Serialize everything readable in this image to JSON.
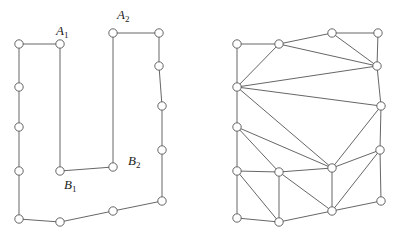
{
  "diagram": {
    "left": {
      "title": "polygon",
      "nodes": [
        {
          "id": "L0",
          "x": 19,
          "y": 44
        },
        {
          "id": "A1",
          "x": 60,
          "y": 44
        },
        {
          "id": "B1",
          "x": 60,
          "y": 171
        },
        {
          "id": "B2",
          "x": 113,
          "y": 167
        },
        {
          "id": "A2",
          "x": 113,
          "y": 33
        },
        {
          "id": "L5",
          "x": 159,
          "y": 33
        },
        {
          "id": "L6",
          "x": 159,
          "y": 66
        },
        {
          "id": "L7",
          "x": 162,
          "y": 106
        },
        {
          "id": "L8",
          "x": 162,
          "y": 150
        },
        {
          "id": "L9",
          "x": 162,
          "y": 201
        },
        {
          "id": "L10",
          "x": 113,
          "y": 211
        },
        {
          "id": "L11",
          "x": 60,
          "y": 222
        },
        {
          "id": "L12",
          "x": 19,
          "y": 219
        },
        {
          "id": "L13",
          "x": 19,
          "y": 171
        },
        {
          "id": "L14",
          "x": 19,
          "y": 127
        },
        {
          "id": "L15",
          "x": 19,
          "y": 87
        }
      ],
      "labels": [
        {
          "base": "A",
          "sub": "1",
          "x": 56,
          "y": 35
        },
        {
          "base": "A",
          "sub": "2",
          "x": 117,
          "y": 19
        },
        {
          "base": "B",
          "sub": "1",
          "x": 64,
          "y": 189
        },
        {
          "base": "B",
          "sub": "2",
          "x": 128,
          "y": 165
        }
      ]
    },
    "right": {
      "title": "triangulation",
      "nodes": [
        {
          "id": "R0",
          "x": 237,
          "y": 44
        },
        {
          "id": "R1",
          "x": 279,
          "y": 44
        },
        {
          "id": "R2",
          "x": 332,
          "y": 33
        },
        {
          "id": "R3",
          "x": 378,
          "y": 33
        },
        {
          "id": "R4",
          "x": 377,
          "y": 66
        },
        {
          "id": "R5",
          "x": 237,
          "y": 87
        },
        {
          "id": "R6",
          "x": 381,
          "y": 106
        },
        {
          "id": "R7",
          "x": 237,
          "y": 127
        },
        {
          "id": "R8",
          "x": 380,
          "y": 150
        },
        {
          "id": "R9",
          "x": 237,
          "y": 171
        },
        {
          "id": "R10",
          "x": 279,
          "y": 172
        },
        {
          "id": "R11",
          "x": 332,
          "y": 168
        },
        {
          "id": "R12",
          "x": 381,
          "y": 201
        },
        {
          "id": "R13",
          "x": 237,
          "y": 218
        },
        {
          "id": "R14",
          "x": 279,
          "y": 222
        },
        {
          "id": "R15",
          "x": 332,
          "y": 211
        }
      ],
      "edges": [
        [
          "R0",
          "R1"
        ],
        [
          "R1",
          "R2"
        ],
        [
          "R2",
          "R3"
        ],
        [
          "R3",
          "R4"
        ],
        [
          "R2",
          "R4"
        ],
        [
          "R1",
          "R4"
        ],
        [
          "R0",
          "R5"
        ],
        [
          "R1",
          "R5"
        ],
        [
          "R5",
          "R4"
        ],
        [
          "R4",
          "R6"
        ],
        [
          "R5",
          "R6"
        ],
        [
          "R5",
          "R7"
        ],
        [
          "R5",
          "R11"
        ],
        [
          "R6",
          "R11"
        ],
        [
          "R6",
          "R8"
        ],
        [
          "R7",
          "R11"
        ],
        [
          "R7",
          "R10"
        ],
        [
          "R7",
          "R9"
        ],
        [
          "R8",
          "R11"
        ],
        [
          "R8",
          "R15"
        ],
        [
          "R8",
          "R12"
        ],
        [
          "R9",
          "R10"
        ],
        [
          "R10",
          "R11"
        ],
        [
          "R11",
          "R15"
        ],
        [
          "R9",
          "R13"
        ],
        [
          "R9",
          "R14"
        ],
        [
          "R10",
          "R14"
        ],
        [
          "R10",
          "R15"
        ],
        [
          "R13",
          "R14"
        ],
        [
          "R14",
          "R15"
        ],
        [
          "R15",
          "R12"
        ]
      ]
    }
  }
}
